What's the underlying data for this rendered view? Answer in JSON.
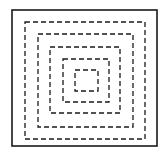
{
  "diagram": {
    "stroke_color": "#1a1a1a",
    "background": "#ffffff",
    "outer_frame": {
      "x": 12,
      "y": 10,
      "w": 145,
      "h": 136,
      "style": "solid"
    },
    "dashed_squares": [
      {
        "x": 25,
        "y": 22,
        "w": 120,
        "h": 117
      },
      {
        "x": 38,
        "y": 34,
        "w": 95,
        "h": 93
      },
      {
        "x": 50,
        "y": 47,
        "w": 70,
        "h": 66
      },
      {
        "x": 63,
        "y": 59,
        "w": 46,
        "h": 43
      },
      {
        "x": 75,
        "y": 70,
        "w": 23,
        "h": 21
      }
    ]
  }
}
